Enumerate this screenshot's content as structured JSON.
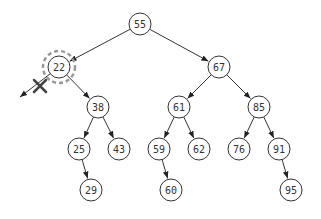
{
  "diagram": {
    "type": "binary-search-tree",
    "node_radius": 11,
    "colors": {
      "stroke": "#333333",
      "highlight": "#999999",
      "background": "#ffffff"
    },
    "nodes": [
      {
        "id": "n55",
        "label": "55",
        "x": 140,
        "y": 24
      },
      {
        "id": "n22",
        "label": "22",
        "x": 59,
        "y": 67,
        "highlighted": true
      },
      {
        "id": "n67",
        "label": "67",
        "x": 219,
        "y": 67
      },
      {
        "id": "n38",
        "label": "38",
        "x": 98,
        "y": 107
      },
      {
        "id": "n61",
        "label": "61",
        "x": 179,
        "y": 107
      },
      {
        "id": "n85",
        "label": "85",
        "x": 259,
        "y": 107
      },
      {
        "id": "n25",
        "label": "25",
        "x": 79,
        "y": 149
      },
      {
        "id": "n43",
        "label": "43",
        "x": 119,
        "y": 149
      },
      {
        "id": "n59",
        "label": "59",
        "x": 159,
        "y": 149
      },
      {
        "id": "n62",
        "label": "62",
        "x": 199,
        "y": 149
      },
      {
        "id": "n76",
        "label": "76",
        "x": 239,
        "y": 149
      },
      {
        "id": "n91",
        "label": "91",
        "x": 279,
        "y": 149
      },
      {
        "id": "n29",
        "label": "29",
        "x": 91,
        "y": 190
      },
      {
        "id": "n60",
        "label": "60",
        "x": 171,
        "y": 190
      },
      {
        "id": "n95",
        "label": "95",
        "x": 291,
        "y": 190
      }
    ],
    "edges": [
      {
        "from": "n55",
        "to": "n22"
      },
      {
        "from": "n55",
        "to": "n67"
      },
      {
        "from": "n22",
        "to": "n38"
      },
      {
        "from": "n67",
        "to": "n61"
      },
      {
        "from": "n67",
        "to": "n85"
      },
      {
        "from": "n38",
        "to": "n25"
      },
      {
        "from": "n38",
        "to": "n43"
      },
      {
        "from": "n61",
        "to": "n59"
      },
      {
        "from": "n61",
        "to": "n62"
      },
      {
        "from": "n85",
        "to": "n76"
      },
      {
        "from": "n85",
        "to": "n91"
      },
      {
        "from": "n25",
        "to": "n29"
      },
      {
        "from": "n59",
        "to": "n60"
      },
      {
        "from": "n91",
        "to": "n95"
      }
    ],
    "removed_edge": {
      "from": "n22",
      "to_point": {
        "x": 20,
        "y": 97
      },
      "cross_at": {
        "x": 40,
        "y": 86
      }
    }
  }
}
